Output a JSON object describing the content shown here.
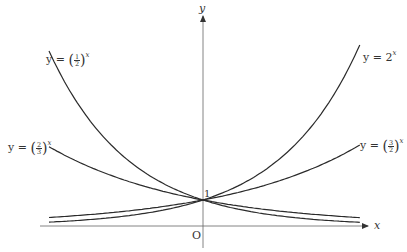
{
  "chart_data": {
    "type": "line",
    "title": "",
    "xlabel": "x",
    "ylabel": "y",
    "origin_label": "O",
    "y_intercept_label": "1",
    "grid": false,
    "legend": "inline labels at curve ends",
    "xlim": [
      -2.8,
      3.6
    ],
    "ylim": [
      -0.5,
      8.0
    ],
    "x_domain": [
      -2.75,
      2.8
    ],
    "series": [
      {
        "name": "y = (1/2)^x",
        "base": 0.5,
        "label_side": "left-top",
        "x": [
          -2.75,
          -2,
          -1,
          0,
          1,
          2,
          2.8
        ],
        "values": [
          6.73,
          4.0,
          2.0,
          1.0,
          0.5,
          0.25,
          0.14
        ]
      },
      {
        "name": "y = 2^x",
        "base": 2,
        "label_side": "right-top",
        "x": [
          -2.75,
          -2,
          -1,
          0,
          1,
          2,
          2.8
        ],
        "values": [
          0.15,
          0.25,
          0.5,
          1.0,
          2.0,
          4.0,
          6.96
        ]
      },
      {
        "name": "y = (2/3)^x",
        "base": 0.6667,
        "label_side": "left-middle",
        "x": [
          -2.75,
          -2,
          -1,
          0,
          1,
          2,
          2.8
        ],
        "values": [
          3.05,
          2.25,
          1.5,
          1.0,
          0.67,
          0.44,
          0.32
        ]
      },
      {
        "name": "y = (3/2)^x",
        "base": 1.5,
        "label_side": "right-middle",
        "x": [
          -2.75,
          -2,
          -1,
          0,
          1,
          2,
          2.8
        ],
        "values": [
          0.33,
          0.44,
          0.67,
          1.0,
          1.5,
          2.25,
          3.11
        ]
      }
    ]
  },
  "labels": {
    "half": {
      "prefix": "y = ",
      "num": "1",
      "den": "2",
      "exp": "x"
    },
    "two": {
      "prefix": "y = 2",
      "exp": "x"
    },
    "twothirds": {
      "prefix": "y = ",
      "num": "2",
      "den": "3",
      "exp": "x"
    },
    "threehalves": {
      "prefix": "y = ",
      "num": "3",
      "den": "2",
      "exp": "x"
    },
    "x_axis": "x",
    "y_axis": "y",
    "origin": "O",
    "one": "1"
  },
  "style": {
    "curve_color": "#2b2b2b",
    "axis_color": "#555555"
  }
}
